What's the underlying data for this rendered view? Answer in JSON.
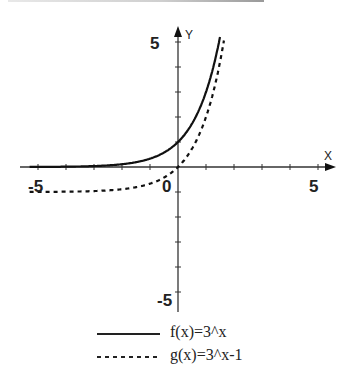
{
  "chart_data": {
    "type": "line",
    "title": "",
    "xlabel": "X",
    "ylabel": "Y",
    "xlim": [
      -5.5,
      5.5
    ],
    "ylim": [
      -5.5,
      5.5
    ],
    "tick_labels": {
      "x": [
        "-5",
        "0",
        "5"
      ],
      "y": [
        "5",
        "-5"
      ]
    },
    "grid": false,
    "legend_position": "bottom",
    "series": [
      {
        "name": "f(x)=3^x",
        "style": "solid",
        "expr": "3^x",
        "x": [
          -5,
          -4,
          -3,
          -2,
          -1,
          0,
          0.5,
          1,
          1.5
        ],
        "y": [
          0.004,
          0.012,
          0.037,
          0.111,
          0.333,
          1,
          1.732,
          3,
          5.196
        ]
      },
      {
        "name": "g(x)=3^x-1",
        "style": "dashed",
        "expr": "3^x-1",
        "x": [
          -5,
          -4,
          -3,
          -2,
          -1,
          0,
          0.5,
          1,
          1.5,
          1.65
        ],
        "y": [
          -0.996,
          -0.988,
          -0.963,
          -0.889,
          -0.667,
          0,
          0.732,
          2,
          4.196,
          5.14
        ]
      }
    ]
  },
  "axes": {
    "x_label": "X",
    "y_label": "Y",
    "x_neg": "-5",
    "x_pos": "5",
    "origin": "0",
    "y_pos": "5",
    "y_neg": "-5"
  },
  "legend": [
    {
      "label": "f(x)=3^x",
      "style": "solid"
    },
    {
      "label": "g(x)=3^x-1",
      "style": "dashed"
    }
  ]
}
